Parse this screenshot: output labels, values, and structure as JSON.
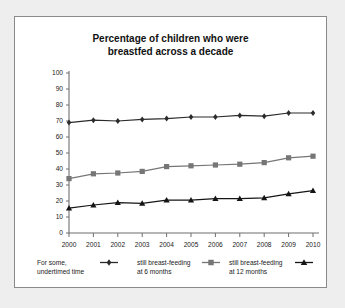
{
  "chart_data": {
    "type": "line",
    "title": "Percentage of children who were breastfed across a decade",
    "title_line1": "Percentage of children who were",
    "title_line2": "breastfed across a decade",
    "xlabel": "",
    "ylabel": "",
    "grid": false,
    "legend_position": "bottom",
    "categories": [
      "2000",
      "2001",
      "2002",
      "2003",
      "2004",
      "2005",
      "2006",
      "2007",
      "2008",
      "2009",
      "2010"
    ],
    "x": [
      2000,
      2001,
      2002,
      2003,
      2004,
      2005,
      2006,
      2007,
      2008,
      2009,
      2010
    ],
    "xlim": [
      2000,
      2010
    ],
    "ylim": [
      0,
      100
    ],
    "yticks": [
      0,
      10,
      20,
      30,
      40,
      50,
      60,
      70,
      80,
      90,
      100
    ],
    "ytick_labels": [
      "0",
      "10",
      "20",
      "30",
      "40",
      "50",
      "60",
      "70",
      "80",
      "90",
      "100"
    ],
    "series": [
      {
        "name": "For some, undertimed time",
        "legend_line1": "For some,",
        "legend_line2": "undertimed time",
        "marker": "diamond",
        "color": "#2b2b2b",
        "values": [
          69,
          70.5,
          70,
          71,
          71.5,
          72.5,
          72.5,
          73.5,
          73,
          75,
          75
        ]
      },
      {
        "name": "still breast-feeding at 6 months",
        "legend_line1": "still breast-feeding",
        "legend_line2": "at 6 months",
        "marker": "square",
        "color": "#767676",
        "values": [
          34,
          37,
          37.5,
          38.5,
          41.5,
          42,
          42.5,
          43,
          44,
          47,
          48
        ]
      },
      {
        "name": "still breast-feeding at 12 months",
        "legend_line1": "still breast-feeding",
        "legend_line2": "at 12 months",
        "marker": "triangle",
        "color": "#151515",
        "values": [
          15.5,
          17.5,
          19,
          18.5,
          20.5,
          20.5,
          21.5,
          21.5,
          22,
          24.5,
          26.5
        ]
      }
    ]
  },
  "figure": {
    "background_color": "#ffffff",
    "page_background_color": "#eeeeee",
    "border_color": "#8a8a8a"
  }
}
